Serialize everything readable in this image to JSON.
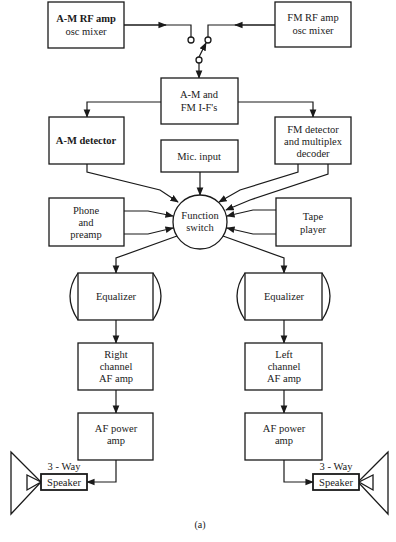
{
  "diagram": {
    "caption": "(a)",
    "blocks": {
      "am_rf": [
        "A-M RF amp",
        "osc mixer"
      ],
      "fm_rf": [
        "FM RF amp",
        "osc mixer"
      ],
      "if": [
        "A-M and",
        "FM I-F's"
      ],
      "am_det": [
        "A-M detector"
      ],
      "mic": [
        "Mic. input"
      ],
      "fm_det": [
        "FM detector",
        "and multiplex",
        "decoder"
      ],
      "phone": [
        "Phone",
        "and",
        "preamp"
      ],
      "func": [
        "Function",
        "switch"
      ],
      "tape": [
        "Tape",
        "player"
      ],
      "eq_right": [
        "Equalizer"
      ],
      "eq_left": [
        "Equalizer"
      ],
      "right_af": [
        "Right",
        "channel",
        "AF amp"
      ],
      "left_af": [
        "Left",
        "channel",
        "AF amp"
      ],
      "right_pwr": [
        "AF power",
        "amp"
      ],
      "left_pwr": [
        "AF power",
        "amp"
      ],
      "spk_left": [
        "Speaker"
      ],
      "spk_right": [
        "Speaker"
      ],
      "spk_left_label": "3 - Way",
      "spk_right_label": "3 - Way"
    },
    "connections": [
      [
        "am_rf",
        "band-switch"
      ],
      [
        "fm_rf",
        "band-switch"
      ],
      [
        "band-switch",
        "if"
      ],
      [
        "if",
        "am_det"
      ],
      [
        "if",
        "fm_det"
      ],
      [
        "am_det",
        "func"
      ],
      [
        "mic",
        "func"
      ],
      [
        "fm_det",
        "func"
      ],
      [
        "fm_det",
        "func"
      ],
      [
        "phone",
        "func"
      ],
      [
        "phone",
        "func"
      ],
      [
        "tape",
        "func"
      ],
      [
        "tape",
        "func"
      ],
      [
        "func",
        "eq_right"
      ],
      [
        "func",
        "eq_left"
      ],
      [
        "eq_right",
        "right_af"
      ],
      [
        "right_af",
        "right_pwr"
      ],
      [
        "right_pwr",
        "spk_left"
      ],
      [
        "eq_left",
        "left_af"
      ],
      [
        "left_af",
        "left_pwr"
      ],
      [
        "left_pwr",
        "spk_right"
      ]
    ]
  }
}
